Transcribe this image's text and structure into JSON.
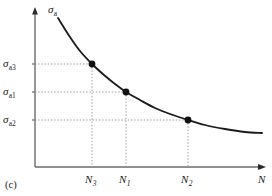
{
  "figure": {
    "caption": "(c)",
    "axes": {
      "y_label_symbol": "σ",
      "y_label_subscript": "a",
      "x_label_symbol": "N",
      "origin_x": 35,
      "origin_y": 167,
      "y_axis_top": 10,
      "x_axis_right": 266
    },
    "colors": {
      "curve": "#1a1a1a",
      "axis": "#6b6b6b",
      "guide": "#9a9a9a",
      "point": "#111111",
      "text": "#1a1a1a",
      "background": "#ffffff"
    }
  },
  "chart_data": {
    "type": "line",
    "title": "",
    "subtitle": "",
    "xlabel": "N",
    "ylabel": "σa",
    "grid": false,
    "legend": "none",
    "curve_description": "Monotonically decreasing fatigue S-N curve (stress amplitude versus number of cycles)",
    "curve_points": [
      {
        "x": 58,
        "y": 18
      },
      {
        "x": 70,
        "y": 37
      },
      {
        "x": 80,
        "y": 51
      },
      {
        "x": 92,
        "y": 64
      },
      {
        "x": 104,
        "y": 75
      },
      {
        "x": 115,
        "y": 84
      },
      {
        "x": 126,
        "y": 92
      },
      {
        "x": 140,
        "y": 100
      },
      {
        "x": 155,
        "y": 108
      },
      {
        "x": 170,
        "y": 114
      },
      {
        "x": 188,
        "y": 120
      },
      {
        "x": 205,
        "y": 125
      },
      {
        "x": 225,
        "y": 129
      },
      {
        "x": 245,
        "y": 132
      },
      {
        "x": 262,
        "y": 133
      }
    ],
    "points": [
      {
        "name": "point-3",
        "x_label": "N",
        "x_subscript": "3",
        "y_label": "σ",
        "y_subscript": "a3",
        "px": 92,
        "py": 64
      },
      {
        "name": "point-1",
        "x_label": "N",
        "x_subscript": "1",
        "y_label": "σ",
        "y_subscript": "a1",
        "px": 126,
        "py": 92
      },
      {
        "name": "point-2",
        "x_label": "N",
        "x_subscript": "2",
        "y_label": "σ",
        "y_subscript": "a2",
        "px": 188,
        "py": 120
      }
    ],
    "y_ticks": [
      {
        "label": "σ",
        "subscript": "a3",
        "py": 64
      },
      {
        "label": "σ",
        "subscript": "a1",
        "py": 92
      },
      {
        "label": "σ",
        "subscript": "a2",
        "py": 120
      }
    ],
    "x_ticks": [
      {
        "label": "N",
        "subscript": "3",
        "px": 92
      },
      {
        "label": "N",
        "subscript": "1",
        "px": 126
      },
      {
        "label": "N",
        "subscript": "2",
        "px": 188
      }
    ]
  }
}
